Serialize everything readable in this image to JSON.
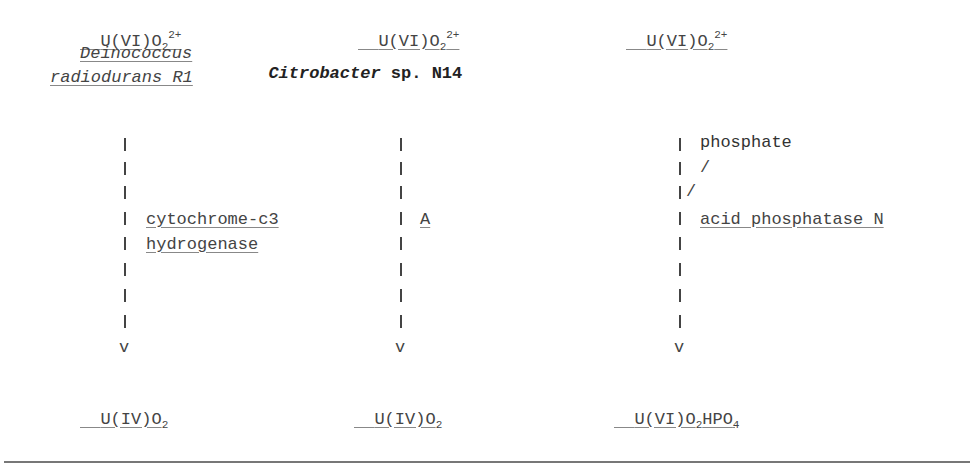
{
  "columns": [
    {
      "substrate": {
        "base": "U(VI)O",
        "sub": "2",
        "sup": "2+"
      },
      "organism": {
        "line1": "Deinococcus",
        "line2": "radiodurans R1"
      },
      "enzyme": {
        "line1": "cytochrome-c3",
        "line2": "hydrogenase"
      },
      "arrow_head": "v",
      "product": {
        "base": "U(IV)O",
        "sub": "2"
      }
    },
    {
      "substrate": {
        "base": "U(VI)O",
        "sub": "2",
        "sup": "2+"
      },
      "organism": {
        "italic": "Citrobacter",
        "rest": " sp. N14"
      },
      "enzyme": {
        "line1": "A"
      },
      "arrow_head": "v",
      "product": {
        "base": "U(IV)O",
        "sub": "2"
      }
    },
    {
      "substrate": {
        "base": "U(VI)O",
        "sub": "2",
        "sup": "2+"
      },
      "cofactor": "phosphate",
      "cofactor_connector": "/",
      "enzyme": {
        "line1": "acid phosphatase N"
      },
      "arrow_head": "v",
      "product": {
        "base1": "U(VI)O",
        "sub1": "2",
        "base2": "HPO",
        "sub2": "4"
      }
    }
  ],
  "colors": {
    "text": "#444444",
    "rule": "#777777",
    "background": "#ffffff"
  }
}
